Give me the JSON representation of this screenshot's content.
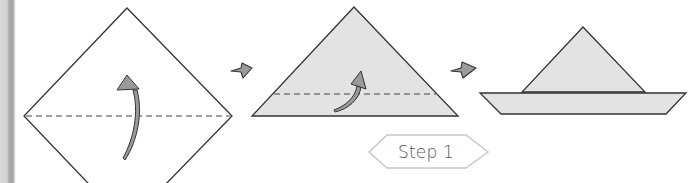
{
  "step_badge": {
    "label": "Step 1"
  },
  "panels": [
    {
      "id": "square-diamond",
      "description": "Square paper turned as a diamond with a horizontal valley fold line; fold bottom up",
      "fold_arrow": "curved-up-arrow",
      "fold_line": "dashed"
    },
    {
      "id": "folded-triangle",
      "description": "Triangle after folding; fold the bottom strip up along the dashed line",
      "fold_arrow": "curved-up-right-arrow",
      "fold_line": "dashed"
    },
    {
      "id": "paper-boat",
      "description": "Finished paper boat with sail and hull"
    }
  ],
  "step_arrows": [
    "right-arrow",
    "right-arrow"
  ],
  "colors": {
    "paper_fill": "#e3e3e3",
    "outline": "#333333",
    "arrow_fill": "#9a9a9a",
    "badge_outline": "#c8c8c8",
    "badge_text": "#555555"
  }
}
